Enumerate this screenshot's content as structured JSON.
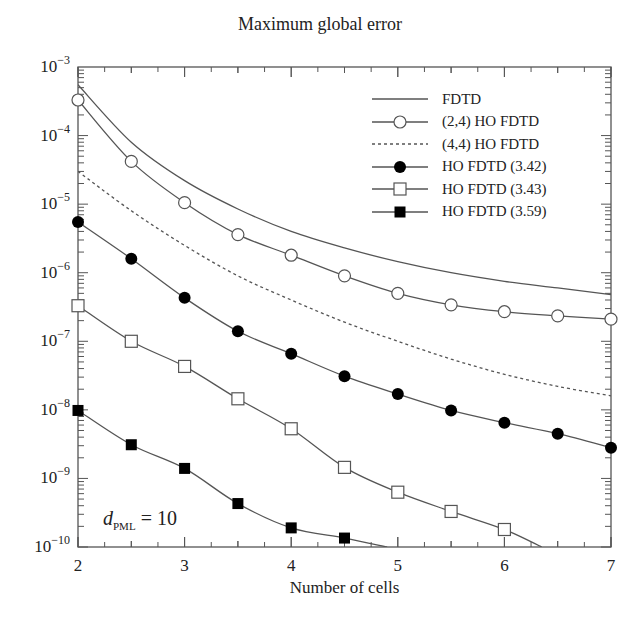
{
  "chart_data": {
    "type": "line",
    "title": "Maximum global error",
    "xlabel": "Number of cells",
    "ylabel": "",
    "yscale": "log",
    "xlim": [
      2,
      7
    ],
    "ylim": [
      1e-10,
      0.001
    ],
    "x_ticks": [
      "2",
      "3",
      "4",
      "5",
      "6",
      "7"
    ],
    "y_ticks": [
      "10^-10",
      "10^-9",
      "10^-8",
      "10^-7",
      "10^-6",
      "10^-5",
      "10^-4",
      "10^-3"
    ],
    "grid": false,
    "legend_position": "upper right",
    "annotation": "d_PML = 10",
    "x": [
      2,
      2.5,
      3,
      3.5,
      4,
      4.5,
      5,
      5.5,
      6,
      6.5,
      7
    ],
    "series": [
      {
        "name": "FDTD",
        "marker": "none",
        "style": "solid",
        "values": [
          0.00055,
          8e-05,
          2.2e-05,
          8.5e-06,
          4e-06,
          2.3e-06,
          1.45e-06,
          1e-06,
          7.5e-07,
          6e-07,
          4.8e-07
        ]
      },
      {
        "name": "(2,4) HO FDTD",
        "marker": "open-circle",
        "style": "solid",
        "values": [
          0.00033,
          4.2e-05,
          1.05e-05,
          3.6e-06,
          1.8e-06,
          9e-07,
          5e-07,
          3.4e-07,
          2.7e-07,
          2.35e-07,
          2.1e-07
        ]
      },
      {
        "name": "(4,4) HO FDTD",
        "marker": "none",
        "style": "dotted",
        "values": [
          3e-05,
          8e-06,
          2.5e-06,
          9e-07,
          4e-07,
          1.9e-07,
          1e-07,
          5.5e-08,
          3.3e-08,
          2.2e-08,
          1.6e-08
        ]
      },
      {
        "name": "HO FDTD (3.42)",
        "marker": "filled-circle",
        "style": "solid",
        "values": [
          5.5e-06,
          1.6e-06,
          4.3e-07,
          1.4e-07,
          6.6e-08,
          3.1e-08,
          1.7e-08,
          9.8e-09,
          6.5e-09,
          4.5e-09,
          2.8e-09
        ]
      },
      {
        "name": "HO FDTD (3.43)",
        "marker": "open-square",
        "style": "solid",
        "values": [
          3.3e-07,
          1e-07,
          4.3e-08,
          1.45e-08,
          5.3e-09,
          1.45e-09,
          6.3e-10,
          3.3e-10,
          1.8e-10,
          null,
          null
        ],
        "line_end": [
          6.35,
          1e-10
        ]
      },
      {
        "name": "HO FDTD (3.59)",
        "marker": "filled-square",
        "style": "solid",
        "values": [
          9.8e-09,
          3.1e-09,
          1.4e-09,
          4.3e-10,
          1.9e-10,
          1.35e-10,
          null,
          null,
          null,
          null,
          null
        ],
        "line_end": [
          4.9,
          1e-10
        ]
      }
    ]
  },
  "labels": {
    "title": "Maximum global error",
    "xlabel": "Number of cells",
    "annot_var": "d",
    "annot_sub": "PML",
    "annot_val": " = 10"
  }
}
